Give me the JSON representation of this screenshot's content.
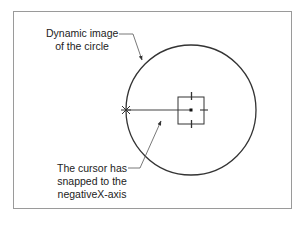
{
  "annotations": {
    "dynamic_image": {
      "line1": "Dynamic image",
      "line2": "of the circle"
    },
    "cursor_snap": {
      "line1": "The cursor has",
      "line2": "snapped to the",
      "line3": "negativeX-axis"
    }
  },
  "geometry": {
    "circle_center": [
      191,
      110
    ],
    "circle_radius": 65,
    "snap_point": [
      126,
      110
    ]
  },
  "colors": {
    "stroke": "#333333",
    "frame": "#9a9a9a",
    "leader": "#555555"
  }
}
